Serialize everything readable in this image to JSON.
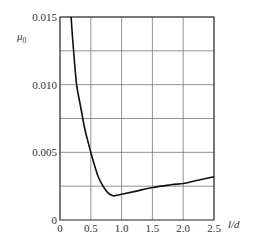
{
  "chart_data": {
    "type": "line",
    "title": "",
    "xlabel": "l/d",
    "ylabel": "μ0",
    "ylabel_main": "μ",
    "ylabel_sub": "0",
    "xlim": [
      0,
      2.5
    ],
    "ylim": [
      0,
      0.015
    ],
    "grid": true,
    "legend": null,
    "x_ticks": [
      "0",
      "0.5",
      "1.0",
      "1.5",
      "2.0",
      "2.5"
    ],
    "x_tick_values": [
      0,
      0.5,
      1.0,
      1.5,
      2.0,
      2.5
    ],
    "y_ticks": [
      "0",
      "0.005",
      "0.010",
      "0.015"
    ],
    "y_tick_values": [
      0,
      0.005,
      0.01,
      0.015
    ],
    "y_grid_values": [
      0.0025,
      0.005,
      0.0075,
      0.01,
      0.0125,
      0.015
    ],
    "series": [
      {
        "name": "μ0 vs l/d",
        "x": [
          0.18,
          0.22,
          0.27,
          0.33,
          0.4,
          0.47,
          0.5,
          0.55,
          0.62,
          0.7,
          0.78,
          0.85,
          0.9,
          1.0,
          1.2,
          1.5,
          1.8,
          2.0,
          2.2,
          2.5
        ],
        "y": [
          0.015,
          0.0125,
          0.01,
          0.0085,
          0.0068,
          0.0055,
          0.005,
          0.0042,
          0.0032,
          0.0025,
          0.002,
          0.0018,
          0.0018,
          0.0019,
          0.0021,
          0.0024,
          0.0026,
          0.0027,
          0.0029,
          0.0032
        ]
      }
    ]
  }
}
